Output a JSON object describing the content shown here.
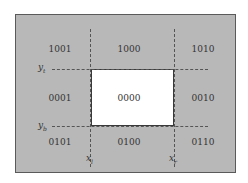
{
  "diagram": {
    "title": "",
    "region_codes": {
      "top_left": "1001",
      "top_center": "1000",
      "top_right": "1010",
      "middle_left": "0001",
      "center": "0000",
      "middle_right": "0010",
      "bottom_left": "0101",
      "bottom_center": "0100",
      "bottom_right": "0110"
    },
    "boundary_labels": {
      "y_top": {
        "base": "y",
        "sub": "t"
      },
      "y_bottom": {
        "base": "y",
        "sub": "b"
      },
      "x_left": {
        "base": "x",
        "sub": "l"
      },
      "x_right": {
        "base": "x",
        "sub": "r"
      }
    },
    "colors": {
      "outside_region": "#b8b8b8",
      "clip_window": "#ffffff",
      "lines": "#555555"
    }
  }
}
